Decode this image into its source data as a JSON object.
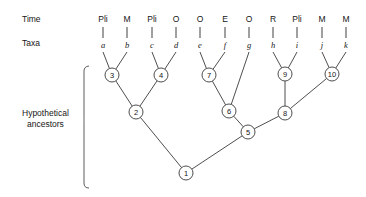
{
  "figure": {
    "row_labels": {
      "time": "Time",
      "taxa": "Taxa"
    },
    "bracket_label_line1": "Hypothetical",
    "bracket_label_line2": "ancestors",
    "line_color": "#3a3a3a",
    "text_color": "#161616",
    "background": "#ffffff"
  },
  "tips": [
    {
      "taxon": "a",
      "time": "Pli",
      "x": 103
    },
    {
      "taxon": "b",
      "time": "M",
      "x": 127
    },
    {
      "taxon": "c",
      "time": "Pli",
      "x": 152
    },
    {
      "taxon": "d",
      "time": "O",
      "x": 176
    },
    {
      "taxon": "e",
      "time": "O",
      "x": 200
    },
    {
      "taxon": "f",
      "time": "E",
      "x": 225
    },
    {
      "taxon": "g",
      "time": "O",
      "x": 249
    },
    {
      "taxon": "h",
      "time": "R",
      "x": 273
    },
    {
      "taxon": "i",
      "time": "Pli",
      "x": 297
    },
    {
      "taxon": "j",
      "time": "M",
      "x": 322
    },
    {
      "taxon": "k",
      "time": "M",
      "x": 346
    }
  ],
  "nodes": [
    {
      "id": "1",
      "label": "1",
      "x": 186,
      "y": 173
    },
    {
      "id": "2",
      "label": "2",
      "x": 136,
      "y": 112
    },
    {
      "id": "3",
      "label": "3",
      "x": 112,
      "y": 75
    },
    {
      "id": "4",
      "label": "4",
      "x": 161,
      "y": 75
    },
    {
      "id": "5",
      "label": "5",
      "x": 248,
      "y": 132
    },
    {
      "id": "6",
      "label": "6",
      "x": 229,
      "y": 111
    },
    {
      "id": "7",
      "label": "7",
      "x": 209,
      "y": 75
    },
    {
      "id": "8",
      "label": "8",
      "x": 285,
      "y": 113
    },
    {
      "id": "9",
      "label": "9",
      "x": 285,
      "y": 74
    },
    {
      "id": "10",
      "label": "10",
      "x": 332,
      "y": 74
    }
  ],
  "edges": [
    {
      "from_taxon": "a",
      "to_node": "3"
    },
    {
      "from_taxon": "b",
      "to_node": "3"
    },
    {
      "from_taxon": "c",
      "to_node": "4"
    },
    {
      "from_taxon": "d",
      "to_node": "4"
    },
    {
      "from_taxon": "e",
      "to_node": "7"
    },
    {
      "from_taxon": "f",
      "to_node": "7"
    },
    {
      "from_taxon": "g",
      "to_node": "6"
    },
    {
      "from_taxon": "h",
      "to_node": "9"
    },
    {
      "from_taxon": "i",
      "to_node": "9"
    },
    {
      "from_taxon": "j",
      "to_node": "10"
    },
    {
      "from_taxon": "k",
      "to_node": "10"
    },
    {
      "from_node": "3",
      "to_node": "2"
    },
    {
      "from_node": "4",
      "to_node": "2"
    },
    {
      "from_node": "7",
      "to_node": "6"
    },
    {
      "from_node": "6",
      "to_node": "5"
    },
    {
      "from_node": "9",
      "to_node": "8"
    },
    {
      "from_node": "10",
      "to_node": "8"
    },
    {
      "from_node": "8",
      "to_node": "5"
    },
    {
      "from_node": "2",
      "to_node": "1"
    },
    {
      "from_node": "5",
      "to_node": "1"
    }
  ],
  "geometry": {
    "time_label_y": 22,
    "taxa_label_y": 46,
    "tick_top": 27,
    "tick_bottom": 38,
    "taxon_label_y": 48,
    "branch_start_y": 52,
    "node_radius": 7,
    "bracket_x": 90,
    "bracket_top": 66,
    "bracket_bottom": 188,
    "bracket_mid": 120,
    "row_label_x": 22,
    "bracket_label_x": 22,
    "bracket_label_y1": 116,
    "bracket_label_y2": 127
  }
}
